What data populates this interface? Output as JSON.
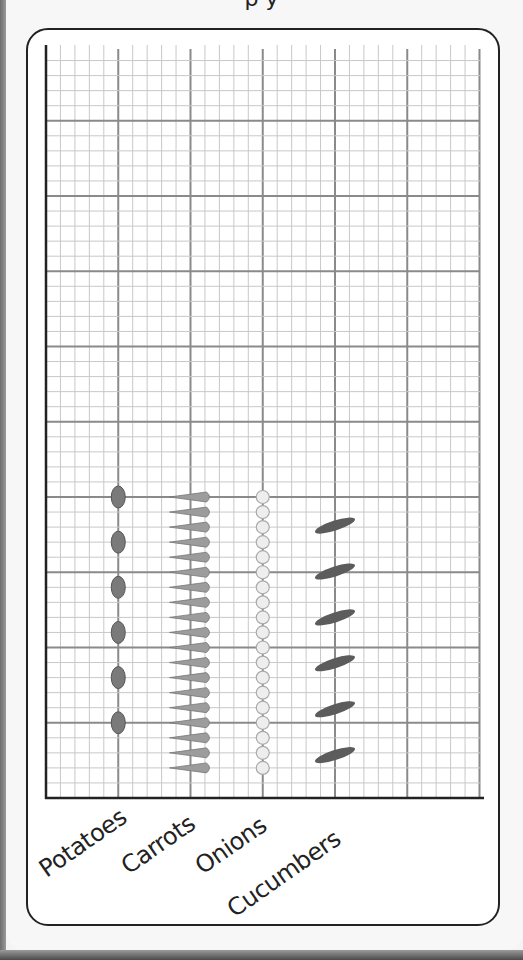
{
  "page": {
    "title_fragment": "p      y"
  },
  "chart_data": {
    "type": "bar",
    "subtype": "pictograph",
    "title": "",
    "xlabel": "",
    "ylabel": "",
    "categories": [
      "Potatoes",
      "Carrots",
      "Onions",
      "Cucumbers"
    ],
    "values": [
      6,
      19,
      19,
      6
    ],
    "value_unit": "pictures",
    "icons": [
      "potato-icon",
      "carrot-icon",
      "onion-icon",
      "cucumber-icon"
    ],
    "grid": true,
    "y_ticks_labeled": false,
    "colors": {
      "potato": "#7a7a7a",
      "carrot": "#9c9c9c",
      "onion": "#eeeeee",
      "cucumber": "#5c5c5c",
      "grid_minor": "#c8c8c8",
      "grid_major": "#8a8a8a",
      "axis": "#222222"
    }
  },
  "labels": {
    "potatoes": "Potatoes",
    "carrots": "Carrots",
    "onions": "Onions",
    "cucumbers": "Cucumbers"
  }
}
